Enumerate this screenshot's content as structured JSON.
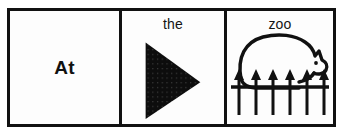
{
  "worksheet": {
    "title": "At the zoo sentence strip",
    "border_color": "#111111",
    "background_color": "#fdfdfd",
    "ink_color": "#111111",
    "panels": [
      {
        "id": "word-panel",
        "word": "At",
        "word_style": "bold",
        "has_picture": false
      },
      {
        "id": "triangle-panel",
        "word": "the",
        "word_style": "regular",
        "has_picture": true,
        "picture": "black-right-pointing-triangle",
        "picture_fill": "#0d0d0d",
        "picture_texture": "fine-dot-grid"
      },
      {
        "id": "zoo-panel",
        "word": "zoo",
        "word_style": "regular",
        "has_picture": true,
        "picture": "bear-behind-fence",
        "picture_fill": "none",
        "picture_stroke": "#111111"
      }
    ]
  }
}
